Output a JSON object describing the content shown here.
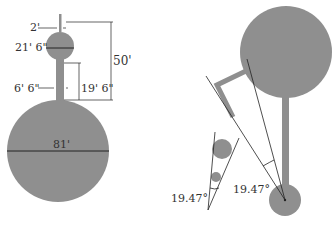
{
  "colors": {
    "shape_fill": "#8f8f8f",
    "line": "#222222",
    "background": "#ffffff"
  },
  "left_diagram": {
    "labels": {
      "antenna_width": "2'",
      "small_sphere_diameter": "21' 6\"",
      "stem_width": "6' 6\"",
      "stem_height": "19' 6\"",
      "total_height": "50'",
      "large_sphere_diameter": "81'"
    }
  },
  "right_diagram": {
    "labels": {
      "angle_main": "19.47°",
      "angle_inset": "19.47°"
    }
  }
}
